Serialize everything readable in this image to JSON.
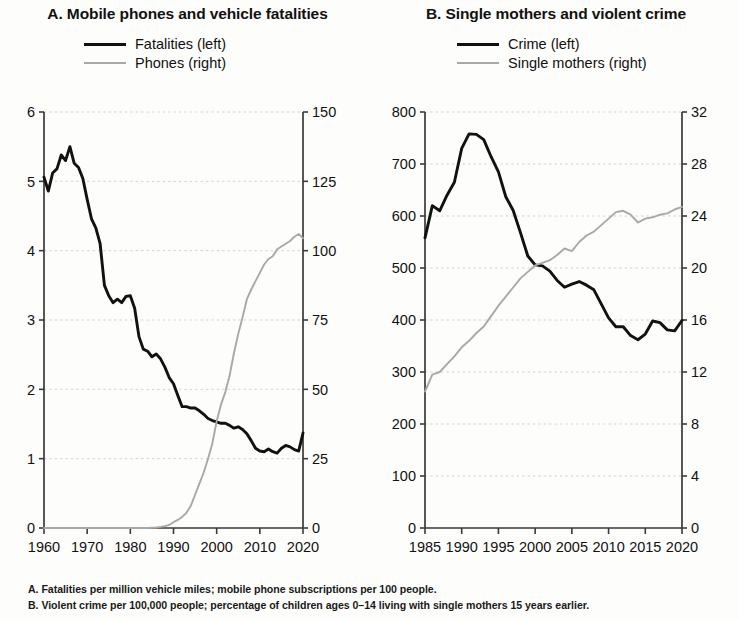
{
  "figure": {
    "footnotes": [
      "A.  Fatalities per million vehicle miles; mobile phone subscriptions per 100 people.",
      "B.  Violent crime per 100,000 people; percentage of children ages 0–14 living with single mothers 15 years earlier."
    ]
  },
  "panel_a": {
    "title": "A. Mobile phones and vehicle fatalities",
    "legend": [
      {
        "label": "Fatalities (left)",
        "color": "#111111",
        "style": "dark"
      },
      {
        "label": "Phones (right)",
        "color": "#a8a8a8",
        "style": "light"
      }
    ]
  },
  "panel_b": {
    "title": "B. Single mothers and violent crime",
    "legend": [
      {
        "label": "Crime (left)",
        "color": "#111111",
        "style": "dark"
      },
      {
        "label": "Single mothers (right)",
        "color": "#a8a8a8",
        "style": "light"
      }
    ]
  },
  "chart_data": [
    {
      "type": "line",
      "panel": "A",
      "title": "A. Mobile phones and vehicle fatalities",
      "xlabel": "",
      "ylabel": "",
      "xlim": [
        1960,
        2020
      ],
      "xticks": [
        1960,
        1970,
        1980,
        1990,
        2000,
        2010,
        2020
      ],
      "y_left": {
        "label": "Fatalities (left)",
        "lim": [
          0,
          6
        ],
        "ticks": [
          0,
          1,
          2,
          3,
          4,
          5,
          6
        ]
      },
      "y_right": {
        "label": "Phones (right)",
        "lim": [
          0,
          150
        ],
        "ticks": [
          0,
          25,
          50,
          75,
          100,
          125,
          150
        ]
      },
      "grid": "horizontal-dotted",
      "legend_position": "top-center",
      "x": [
        1960,
        1961,
        1962,
        1963,
        1964,
        1965,
        1966,
        1967,
        1968,
        1969,
        1970,
        1971,
        1972,
        1973,
        1974,
        1975,
        1976,
        1977,
        1978,
        1979,
        1980,
        1981,
        1982,
        1983,
        1984,
        1985,
        1986,
        1987,
        1988,
        1989,
        1990,
        1991,
        1992,
        1993,
        1994,
        1995,
        1996,
        1997,
        1998,
        1999,
        2000,
        2001,
        2002,
        2003,
        2004,
        2005,
        2006,
        2007,
        2008,
        2009,
        2010,
        2011,
        2012,
        2013,
        2014,
        2015,
        2016,
        2017,
        2018,
        2019,
        2020
      ],
      "series": [
        {
          "name": "Fatalities (left)",
          "axis": "left",
          "color": "#111111",
          "values": [
            5.06,
            4.86,
            5.12,
            5.18,
            5.38,
            5.3,
            5.5,
            5.26,
            5.2,
            5.04,
            4.74,
            4.46,
            4.33,
            4.1,
            3.5,
            3.35,
            3.25,
            3.3,
            3.25,
            3.34,
            3.35,
            3.17,
            2.76,
            2.58,
            2.55,
            2.47,
            2.51,
            2.44,
            2.32,
            2.17,
            2.08,
            1.91,
            1.75,
            1.75,
            1.73,
            1.73,
            1.69,
            1.64,
            1.58,
            1.55,
            1.53,
            1.51,
            1.51,
            1.48,
            1.44,
            1.46,
            1.42,
            1.36,
            1.26,
            1.15,
            1.11,
            1.1,
            1.14,
            1.1,
            1.08,
            1.15,
            1.19,
            1.17,
            1.13,
            1.11,
            1.37
          ]
        },
        {
          "name": "Phones (right)",
          "axis": "right",
          "color": "#a8a8a8",
          "values": [
            0,
            0,
            0,
            0,
            0,
            0,
            0,
            0,
            0,
            0,
            0,
            0,
            0,
            0,
            0,
            0,
            0,
            0,
            0,
            0,
            0,
            0,
            0,
            0,
            0,
            0.1,
            0.2,
            0.4,
            0.7,
            1.1,
            2.1,
            2.9,
            4.0,
            5.5,
            8.0,
            12.0,
            16.0,
            20.0,
            25.0,
            30.5,
            38.5,
            44.5,
            49.0,
            55.0,
            63.0,
            70.0,
            76.0,
            82.5,
            86.0,
            89.0,
            92.0,
            95.0,
            97.0,
            98.0,
            100.5,
            101.5,
            102.5,
            103.5,
            105.0,
            106.0,
            104.5
          ]
        }
      ]
    },
    {
      "type": "line",
      "panel": "B",
      "title": "B. Single mothers and violent crime",
      "xlabel": "",
      "ylabel": "",
      "xlim": [
        1985,
        2020
      ],
      "xticks": [
        1985,
        1990,
        1995,
        2000,
        2005,
        2010,
        2015,
        2020
      ],
      "y_left": {
        "label": "Crime (left)",
        "lim": [
          0,
          800
        ],
        "ticks": [
          0,
          100,
          200,
          300,
          400,
          500,
          600,
          700,
          800
        ]
      },
      "y_right": {
        "label": "Single mothers (right)",
        "lim": [
          0,
          32
        ],
        "ticks": [
          0,
          4,
          8,
          12,
          16,
          20,
          24,
          28,
          32
        ]
      },
      "grid": "horizontal-dotted",
      "legend_position": "top-center",
      "x": [
        1985,
        1986,
        1987,
        1988,
        1989,
        1990,
        1991,
        1992,
        1993,
        1994,
        1995,
        1996,
        1997,
        1998,
        1999,
        2000,
        2001,
        2002,
        2003,
        2004,
        2005,
        2006,
        2007,
        2008,
        2009,
        2010,
        2011,
        2012,
        2013,
        2014,
        2015,
        2016,
        2017,
        2018,
        2019,
        2020
      ],
      "series": [
        {
          "name": "Crime (left)",
          "axis": "left",
          "color": "#111111",
          "values": [
            558,
            620,
            610,
            640,
            665,
            730,
            758,
            757,
            747,
            714,
            685,
            637,
            611,
            568,
            523,
            506,
            504,
            494,
            476,
            463,
            469,
            474,
            467,
            458,
            431,
            404,
            387,
            387,
            370,
            362,
            373,
            398,
            395,
            381,
            379,
            399
          ]
        },
        {
          "name": "Single mothers (right)",
          "axis": "right",
          "color": "#a8a8a8",
          "values": [
            10.5,
            11.8,
            12.0,
            12.6,
            13.2,
            13.9,
            14.4,
            15.0,
            15.5,
            16.3,
            17.1,
            17.8,
            18.5,
            19.2,
            19.7,
            20.2,
            20.4,
            20.6,
            21.0,
            21.5,
            21.3,
            22.0,
            22.5,
            22.8,
            23.3,
            23.8,
            24.3,
            24.4,
            24.1,
            23.5,
            23.8,
            23.9,
            24.1,
            24.2,
            24.5,
            24.7
          ]
        }
      ]
    }
  ]
}
